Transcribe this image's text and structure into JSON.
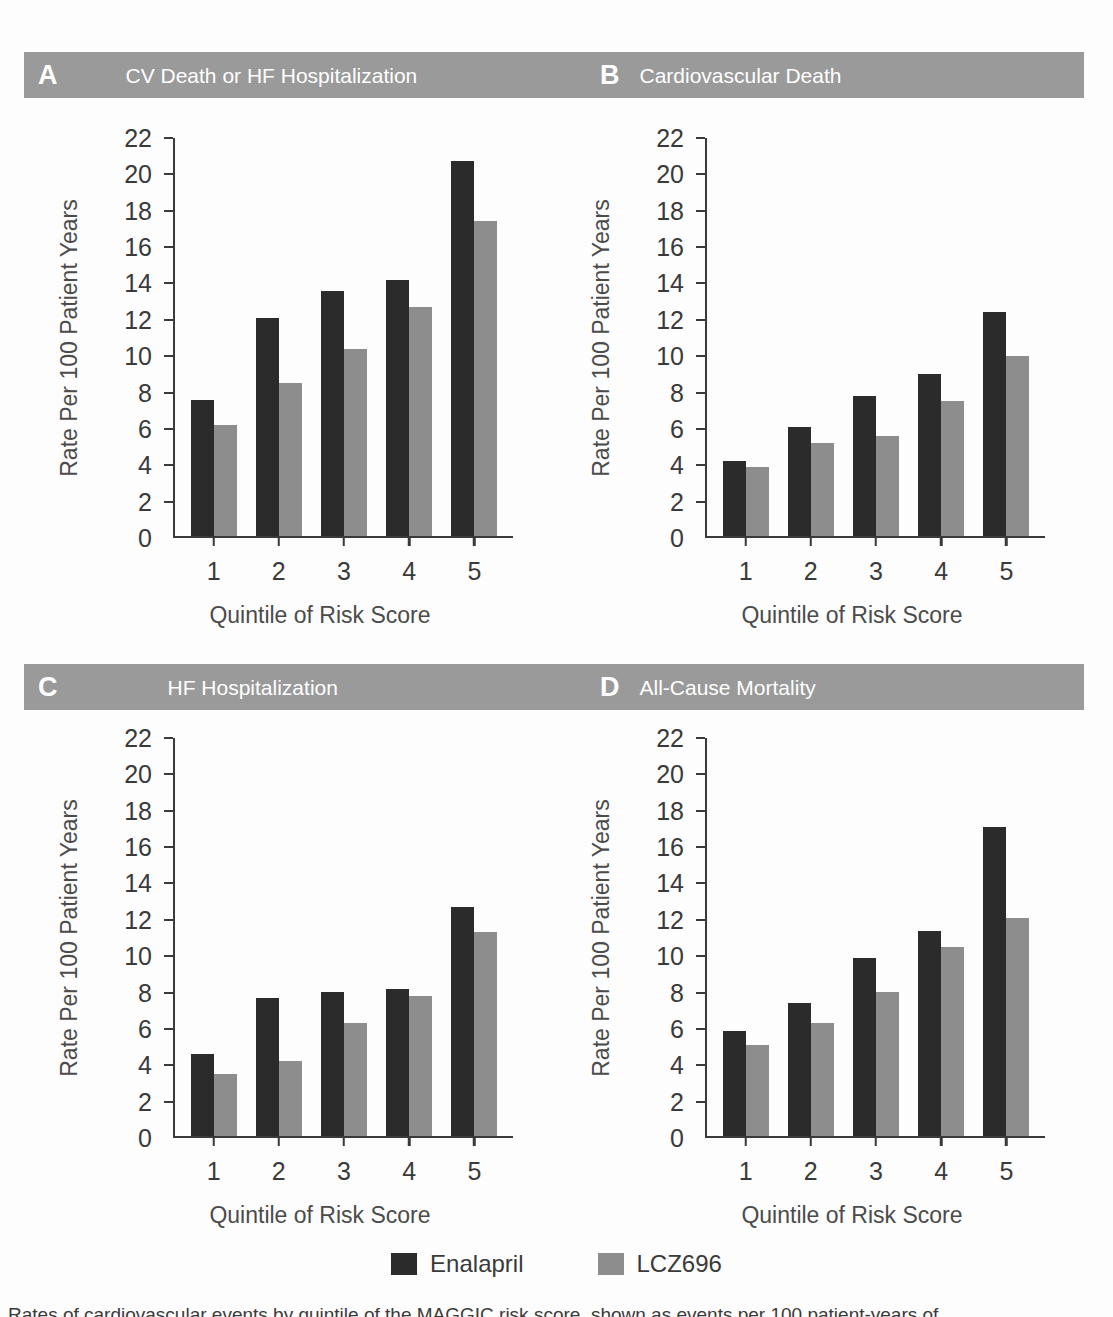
{
  "figure": {
    "ylabel": "Rate Per 100 Patient Years",
    "xlabel": "Quintile of Risk Score",
    "yticks": [
      "0",
      "2",
      "4",
      "6",
      "8",
      "10",
      "12",
      "14",
      "16",
      "18",
      "20",
      "22"
    ],
    "xticks": [
      "1",
      "2",
      "3",
      "4",
      "5"
    ],
    "caption": "Rates of cardiovascular events by quintile of the MAGGIC risk score, shown as events per 100 patient-years of"
  },
  "legend": {
    "items": [
      {
        "label": "Enalapril",
        "color": "#2b2b2b"
      },
      {
        "label": "LCZ696",
        "color": "#8d8d8d"
      }
    ]
  },
  "colors": {
    "enalapril": "#2b2b2b",
    "lcz696": "#8d8d8d",
    "header_bar": "#9a9a9a",
    "header_text": "#ffffff",
    "axis": "#3a3a3a"
  },
  "panels": {
    "A": {
      "letter": "A",
      "title": "CV Death or HF Hospitalization"
    },
    "B": {
      "letter": "B",
      "title": "Cardiovascular Death"
    },
    "C": {
      "letter": "C",
      "title": "HF Hospitalization"
    },
    "D": {
      "letter": "D",
      "title": "All-Cause Mortality"
    }
  },
  "chart_data": [
    {
      "panel": "A",
      "type": "bar",
      "title": "CV Death or HF Hospitalization",
      "xlabel": "Quintile of Risk Score",
      "ylabel": "Rate Per 100 Patient Years",
      "categories": [
        "1",
        "2",
        "3",
        "4",
        "5"
      ],
      "ylim": [
        0,
        22
      ],
      "ytick_step": 2,
      "grid": false,
      "legend_position": "bottom",
      "series": [
        {
          "name": "Enalapril",
          "color": "#2b2b2b",
          "values": [
            7.5,
            12.0,
            13.5,
            14.1,
            20.6
          ]
        },
        {
          "name": "LCZ696",
          "color": "#8d8d8d",
          "values": [
            6.1,
            8.4,
            10.3,
            12.6,
            17.3
          ]
        }
      ]
    },
    {
      "panel": "B",
      "type": "bar",
      "title": "Cardiovascular Death",
      "xlabel": "Quintile of Risk Score",
      "ylabel": "Rate Per 100 Patient Years",
      "categories": [
        "1",
        "2",
        "3",
        "4",
        "5"
      ],
      "ylim": [
        0,
        22
      ],
      "ytick_step": 2,
      "grid": false,
      "legend_position": "bottom",
      "series": [
        {
          "name": "Enalapril",
          "color": "#2b2b2b",
          "values": [
            4.1,
            6.0,
            7.7,
            8.9,
            12.3
          ]
        },
        {
          "name": "LCZ696",
          "color": "#8d8d8d",
          "values": [
            3.8,
            5.1,
            5.5,
            7.4,
            9.9
          ]
        }
      ]
    },
    {
      "panel": "C",
      "type": "bar",
      "title": "HF Hospitalization",
      "xlabel": "Quintile of Risk Score",
      "ylabel": "Rate Per 100 Patient Years",
      "categories": [
        "1",
        "2",
        "3",
        "4",
        "5"
      ],
      "ylim": [
        0,
        22
      ],
      "ytick_step": 2,
      "grid": false,
      "legend_position": "bottom",
      "series": [
        {
          "name": "Enalapril",
          "color": "#2b2b2b",
          "values": [
            4.5,
            7.6,
            7.9,
            8.1,
            12.6
          ]
        },
        {
          "name": "LCZ696",
          "color": "#8d8d8d",
          "values": [
            3.4,
            4.1,
            6.2,
            7.7,
            11.2
          ]
        }
      ]
    },
    {
      "panel": "D",
      "type": "bar",
      "title": "All-Cause Mortality",
      "xlabel": "Quintile of Risk Score",
      "ylabel": "Rate Per 100 Patient Years",
      "categories": [
        "1",
        "2",
        "3",
        "4",
        "5"
      ],
      "ylim": [
        0,
        22
      ],
      "ytick_step": 2,
      "grid": false,
      "legend_position": "bottom",
      "series": [
        {
          "name": "Enalapril",
          "color": "#2b2b2b",
          "values": [
            5.8,
            7.3,
            9.8,
            11.3,
            17.0
          ]
        },
        {
          "name": "LCZ696",
          "color": "#8d8d8d",
          "values": [
            5.0,
            6.2,
            7.9,
            10.4,
            12.0
          ]
        }
      ]
    }
  ]
}
